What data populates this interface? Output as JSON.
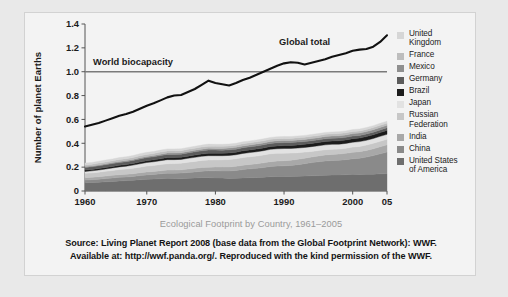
{
  "figure": {
    "caption": "Ecological Footprint by Country, 1961–2005",
    "source_line1": "Source: Living Planet Report 2008 (base data from the Global Footprint Network): WWF.",
    "source_line2": "Available at: http://wwf.panda.org/. Reproduced with the kind permission of the WWF."
  },
  "legend": {
    "items": [
      {
        "label": "United\nKingdom",
        "color": "#d6d6d6",
        "name": "united-kingdom"
      },
      {
        "label": "France",
        "color": "#bdbdbd",
        "name": "france"
      },
      {
        "label": "Mexico",
        "color": "#8f8f8f",
        "name": "mexico"
      },
      {
        "label": "Germany",
        "color": "#5c5c5c",
        "name": "germany"
      },
      {
        "label": "Brazil",
        "color": "#1c1c1c",
        "name": "brazil"
      },
      {
        "label": "Japan",
        "color": "#e2e2e2",
        "name": "japan"
      },
      {
        "label": "Russian\nFederation",
        "color": "#c7c7c7",
        "name": "russian-federation"
      },
      {
        "label": "India",
        "color": "#a8a8a8",
        "name": "india"
      },
      {
        "label": "China",
        "color": "#8a8a8a",
        "name": "china"
      },
      {
        "label": "United States\nof America",
        "color": "#6e6e6e",
        "name": "united-states-of-america"
      }
    ]
  },
  "chart_data": {
    "type": "area",
    "title": "Ecological Footprint by Country, 1961–2005",
    "xlabel": "",
    "ylabel": "Number of planet Earths",
    "xlim": [
      1961,
      2005
    ],
    "ylim": [
      0,
      1.4
    ],
    "ytick_labels": [
      "0",
      "0.2",
      "0.4",
      "0.6",
      "0.8",
      "1.0",
      "1.2",
      "1.4"
    ],
    "ytick_values": [
      0,
      0.2,
      0.4,
      0.6,
      0.8,
      1.0,
      1.2,
      1.4
    ],
    "xtick_labels": [
      "1960",
      "1970",
      "1980",
      "1990",
      "2000",
      "05"
    ],
    "xtick_values": [
      1960,
      1970,
      1980,
      1990,
      2000,
      2005
    ],
    "grid": false,
    "legend_position": "right",
    "stacked": true,
    "annotations": [
      {
        "text": "Global total",
        "x": 1993,
        "y": 1.22,
        "name": "global-total-label"
      },
      {
        "text": "World biocapacity",
        "x": 1968,
        "y": 1.06,
        "name": "world-biocapacity-label"
      }
    ],
    "reference_lines": [
      {
        "name": "world-biocapacity",
        "label": "World biocapacity",
        "y": 1.0,
        "color": "#7a7a7a"
      }
    ],
    "x": [
      1961,
      1962,
      1963,
      1964,
      1965,
      1966,
      1967,
      1968,
      1969,
      1970,
      1971,
      1972,
      1973,
      1974,
      1975,
      1976,
      1977,
      1978,
      1979,
      1980,
      1981,
      1982,
      1983,
      1984,
      1985,
      1986,
      1987,
      1988,
      1989,
      1990,
      1991,
      1992,
      1993,
      1994,
      1995,
      1996,
      1997,
      1998,
      1999,
      2000,
      2001,
      2002,
      2003,
      2004,
      2005
    ],
    "series": [
      {
        "name": "United States of America",
        "color": "#6e6e6e",
        "values": [
          0.07,
          0.072,
          0.074,
          0.077,
          0.08,
          0.084,
          0.087,
          0.091,
          0.095,
          0.098,
          0.1,
          0.103,
          0.106,
          0.105,
          0.103,
          0.107,
          0.11,
          0.112,
          0.112,
          0.11,
          0.108,
          0.105,
          0.106,
          0.11,
          0.112,
          0.113,
          0.116,
          0.12,
          0.122,
          0.122,
          0.121,
          0.123,
          0.125,
          0.128,
          0.129,
          0.132,
          0.134,
          0.135,
          0.137,
          0.14,
          0.139,
          0.14,
          0.141,
          0.144,
          0.146
        ]
      },
      {
        "name": "China",
        "color": "#8a8a8a",
        "values": [
          0.022,
          0.023,
          0.025,
          0.027,
          0.029,
          0.031,
          0.03,
          0.031,
          0.034,
          0.037,
          0.039,
          0.041,
          0.043,
          0.044,
          0.047,
          0.048,
          0.05,
          0.054,
          0.057,
          0.059,
          0.06,
          0.063,
          0.066,
          0.07,
          0.074,
          0.077,
          0.081,
          0.085,
          0.087,
          0.089,
          0.093,
          0.098,
          0.104,
          0.11,
          0.116,
          0.12,
          0.122,
          0.123,
          0.126,
          0.13,
          0.136,
          0.144,
          0.156,
          0.168,
          0.18
        ]
      },
      {
        "name": "India",
        "color": "#a8a8a8",
        "values": [
          0.02,
          0.02,
          0.021,
          0.021,
          0.022,
          0.022,
          0.023,
          0.023,
          0.024,
          0.025,
          0.025,
          0.026,
          0.027,
          0.027,
          0.028,
          0.029,
          0.03,
          0.031,
          0.031,
          0.032,
          0.033,
          0.034,
          0.035,
          0.036,
          0.037,
          0.038,
          0.039,
          0.041,
          0.042,
          0.043,
          0.044,
          0.045,
          0.046,
          0.047,
          0.049,
          0.05,
          0.051,
          0.052,
          0.053,
          0.054,
          0.055,
          0.056,
          0.057,
          0.059,
          0.061
        ]
      },
      {
        "name": "Russian Federation",
        "color": "#c7c7c7",
        "values": [
          0.036,
          0.037,
          0.038,
          0.04,
          0.041,
          0.043,
          0.044,
          0.046,
          0.047,
          0.049,
          0.05,
          0.052,
          0.053,
          0.054,
          0.055,
          0.057,
          0.058,
          0.059,
          0.06,
          0.06,
          0.061,
          0.062,
          0.063,
          0.064,
          0.064,
          0.065,
          0.066,
          0.066,
          0.065,
          0.063,
          0.06,
          0.055,
          0.051,
          0.047,
          0.045,
          0.044,
          0.043,
          0.042,
          0.043,
          0.044,
          0.044,
          0.045,
          0.046,
          0.046,
          0.047
        ]
      },
      {
        "name": "Japan",
        "color": "#e2e2e2",
        "values": [
          0.016,
          0.017,
          0.018,
          0.019,
          0.021,
          0.022,
          0.024,
          0.026,
          0.028,
          0.03,
          0.031,
          0.032,
          0.034,
          0.033,
          0.032,
          0.033,
          0.034,
          0.035,
          0.036,
          0.035,
          0.034,
          0.034,
          0.034,
          0.035,
          0.035,
          0.036,
          0.036,
          0.037,
          0.038,
          0.039,
          0.039,
          0.039,
          0.039,
          0.04,
          0.04,
          0.041,
          0.041,
          0.04,
          0.04,
          0.041,
          0.04,
          0.04,
          0.04,
          0.041,
          0.041
        ]
      },
      {
        "name": "Brazil",
        "color": "#1c1c1c",
        "values": [
          0.012,
          0.012,
          0.012,
          0.013,
          0.013,
          0.013,
          0.014,
          0.014,
          0.015,
          0.015,
          0.016,
          0.016,
          0.017,
          0.017,
          0.018,
          0.018,
          0.019,
          0.019,
          0.02,
          0.02,
          0.02,
          0.021,
          0.021,
          0.022,
          0.022,
          0.023,
          0.023,
          0.024,
          0.024,
          0.025,
          0.025,
          0.026,
          0.026,
          0.027,
          0.027,
          0.028,
          0.028,
          0.029,
          0.029,
          0.03,
          0.03,
          0.031,
          0.031,
          0.032,
          0.033
        ]
      },
      {
        "name": "Germany",
        "color": "#5c5c5c",
        "values": [
          0.022,
          0.022,
          0.023,
          0.023,
          0.024,
          0.024,
          0.024,
          0.025,
          0.026,
          0.026,
          0.026,
          0.027,
          0.027,
          0.026,
          0.026,
          0.027,
          0.027,
          0.027,
          0.028,
          0.027,
          0.026,
          0.026,
          0.026,
          0.026,
          0.026,
          0.026,
          0.026,
          0.026,
          0.026,
          0.025,
          0.024,
          0.024,
          0.023,
          0.023,
          0.023,
          0.023,
          0.023,
          0.023,
          0.022,
          0.022,
          0.022,
          0.022,
          0.022,
          0.022,
          0.022
        ]
      },
      {
        "name": "Mexico",
        "color": "#8f8f8f",
        "values": [
          0.007,
          0.007,
          0.008,
          0.008,
          0.008,
          0.009,
          0.009,
          0.009,
          0.01,
          0.01,
          0.01,
          0.011,
          0.011,
          0.012,
          0.012,
          0.012,
          0.013,
          0.013,
          0.014,
          0.014,
          0.015,
          0.015,
          0.015,
          0.015,
          0.016,
          0.016,
          0.016,
          0.016,
          0.017,
          0.017,
          0.017,
          0.018,
          0.018,
          0.018,
          0.018,
          0.019,
          0.019,
          0.019,
          0.02,
          0.02,
          0.02,
          0.02,
          0.021,
          0.021,
          0.021
        ]
      },
      {
        "name": "France",
        "color": "#bdbdbd",
        "values": [
          0.014,
          0.014,
          0.015,
          0.015,
          0.015,
          0.016,
          0.016,
          0.016,
          0.017,
          0.017,
          0.017,
          0.018,
          0.018,
          0.018,
          0.017,
          0.018,
          0.018,
          0.018,
          0.018,
          0.018,
          0.018,
          0.018,
          0.018,
          0.018,
          0.018,
          0.018,
          0.018,
          0.018,
          0.018,
          0.018,
          0.018,
          0.018,
          0.018,
          0.018,
          0.018,
          0.018,
          0.018,
          0.018,
          0.018,
          0.018,
          0.018,
          0.018,
          0.018,
          0.018,
          0.018
        ]
      },
      {
        "name": "United Kingdom",
        "color": "#d6d6d6",
        "values": [
          0.015,
          0.015,
          0.015,
          0.016,
          0.016,
          0.016,
          0.016,
          0.016,
          0.017,
          0.017,
          0.017,
          0.017,
          0.017,
          0.017,
          0.016,
          0.016,
          0.016,
          0.017,
          0.017,
          0.016,
          0.016,
          0.016,
          0.016,
          0.016,
          0.016,
          0.016,
          0.016,
          0.016,
          0.016,
          0.016,
          0.016,
          0.016,
          0.016,
          0.016,
          0.016,
          0.016,
          0.016,
          0.016,
          0.016,
          0.016,
          0.016,
          0.016,
          0.016,
          0.016,
          0.016
        ]
      }
    ],
    "global_total": {
      "name": "Global total",
      "color": "#111111",
      "values": [
        0.54,
        0.555,
        0.57,
        0.59,
        0.61,
        0.63,
        0.645,
        0.665,
        0.69,
        0.715,
        0.735,
        0.76,
        0.785,
        0.8,
        0.805,
        0.83,
        0.855,
        0.89,
        0.925,
        0.905,
        0.895,
        0.885,
        0.905,
        0.93,
        0.95,
        0.975,
        1.0,
        1.025,
        1.05,
        1.07,
        1.08,
        1.075,
        1.06,
        1.075,
        1.09,
        1.105,
        1.125,
        1.14,
        1.155,
        1.175,
        1.185,
        1.19,
        1.21,
        1.25,
        1.305
      ]
    }
  }
}
